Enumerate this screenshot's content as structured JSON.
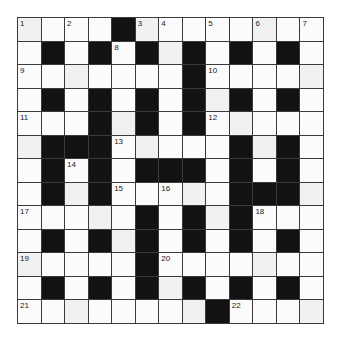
{
  "puzzle": {
    "type": "crossword",
    "rows": 13,
    "cols": 13,
    "grid": [
      "....#........",
      ".#.#.#.#.#.#.",
      ".......#.....",
      ".#.#.#.#.#.#.",
      "...#.#.#.....",
      ".###.....#.#.",
      ".#.#.###.#.#.",
      ".#.#.....###.",
      ".....#.#.#...",
      ".#.#.#.#.#.#.",
      ".....#.......",
      ".#.#.#.#.#.#.",
      "........#...."
    ],
    "numbers": [
      {
        "row": 0,
        "col": 0,
        "n": "1"
      },
      {
        "row": 0,
        "col": 2,
        "n": "2"
      },
      {
        "row": 0,
        "col": 5,
        "n": "3"
      },
      {
        "row": 0,
        "col": 6,
        "n": "4"
      },
      {
        "row": 0,
        "col": 8,
        "n": "5"
      },
      {
        "row": 0,
        "col": 10,
        "n": "6"
      },
      {
        "row": 0,
        "col": 12,
        "n": "7"
      },
      {
        "row": 1,
        "col": 4,
        "n": "8"
      },
      {
        "row": 2,
        "col": 0,
        "n": "9"
      },
      {
        "row": 2,
        "col": 8,
        "n": "10"
      },
      {
        "row": 4,
        "col": 0,
        "n": "11"
      },
      {
        "row": 4,
        "col": 8,
        "n": "12"
      },
      {
        "row": 5,
        "col": 4,
        "n": "13"
      },
      {
        "row": 6,
        "col": 2,
        "n": "14"
      },
      {
        "row": 7,
        "col": 4,
        "n": "15"
      },
      {
        "row": 7,
        "col": 6,
        "n": "16"
      },
      {
        "row": 8,
        "col": 0,
        "n": "17"
      },
      {
        "row": 8,
        "col": 10,
        "n": "18"
      },
      {
        "row": 10,
        "col": 0,
        "n": "19"
      },
      {
        "row": 10,
        "col": 6,
        "n": "20"
      },
      {
        "row": 12,
        "col": 0,
        "n": "21"
      },
      {
        "row": 12,
        "col": 9,
        "n": "22"
      }
    ],
    "colors": {
      "block": "#121212",
      "cell": "#fbfbfb",
      "border": "#3a3a3a",
      "number": "#222222"
    }
  }
}
